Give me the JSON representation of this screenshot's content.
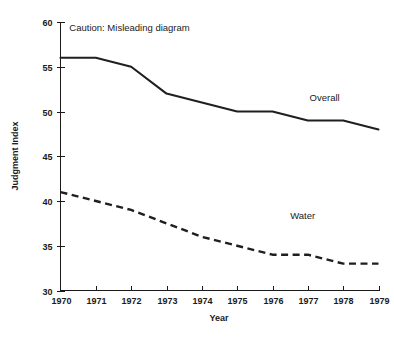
{
  "chart_data": {
    "type": "line",
    "title": "",
    "subtitle": "",
    "xlabel": "Year",
    "ylabel": "Judgment Index",
    "categories": [
      1970,
      1971,
      1972,
      1973,
      1974,
      1975,
      1976,
      1977,
      1978,
      1979
    ],
    "x": [
      1970,
      1971,
      1972,
      1973,
      1974,
      1975,
      1976,
      1977,
      1978,
      1979
    ],
    "xtick_labels": [
      "1970",
      "1971",
      "1972",
      "1973",
      "1974",
      "1975",
      "1976",
      "1977",
      "1978",
      "1979"
    ],
    "ytick_labels": [
      "30",
      "35",
      "40",
      "45",
      "50",
      "55",
      "60"
    ],
    "yticks": [
      30,
      35,
      40,
      45,
      50,
      55,
      60
    ],
    "xlim": [
      1970,
      1979
    ],
    "ylim": [
      30,
      60
    ],
    "grid": false,
    "legend_position": "inline-right",
    "series": [
      {
        "name": "Overall",
        "style": "solid",
        "color": "#1f1f1f",
        "label_x": 1977.05,
        "label_y": 51.2,
        "values": [
          56,
          56,
          55,
          52,
          51,
          50,
          50,
          49,
          49,
          48
        ]
      },
      {
        "name": "Water",
        "style": "dashed",
        "color": "#1f1f1f",
        "label_x": 1976.5,
        "label_y": 38.0,
        "values": [
          41,
          40,
          39,
          37.5,
          36,
          35,
          34,
          34,
          33,
          33
        ]
      }
    ],
    "annotations": [
      {
        "text": "Caution: Misleading diagram",
        "x": 1970.25,
        "y": 59.0
      }
    ]
  },
  "axis": {
    "ylabel": "Judgment Index",
    "xlabel": "Year"
  }
}
